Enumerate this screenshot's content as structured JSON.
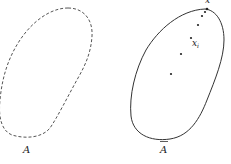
{
  "figure": {
    "set_a": {
      "label": "A",
      "boundary_style": "dashed"
    },
    "set_a_closure": {
      "label": "A",
      "overbar": true,
      "boundary_style": "solid"
    },
    "sequence": {
      "point_label": "x",
      "point_subscript": "i",
      "limit_label": "x",
      "points": [
        {
          "x": 171,
          "y": 74
        },
        {
          "x": 181,
          "y": 54
        },
        {
          "x": 191,
          "y": 38
        },
        {
          "x": 198,
          "y": 25
        },
        {
          "x": 202,
          "y": 16
        },
        {
          "x": 205,
          "y": 12
        },
        {
          "x": 207,
          "y": 9
        }
      ]
    }
  }
}
